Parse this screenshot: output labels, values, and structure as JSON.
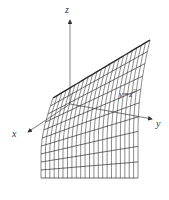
{
  "figure": {
    "equation_label": "y=z",
    "equation_exponent": "2",
    "axes": {
      "x_label": "x",
      "y_label": "y",
      "z_label": "z"
    },
    "colors": {
      "axis": "#555555",
      "mesh": "#2a2a2a",
      "background": "#ffffff"
    },
    "mesh": {
      "u_lines": 22,
      "v_lines": 10
    }
  }
}
